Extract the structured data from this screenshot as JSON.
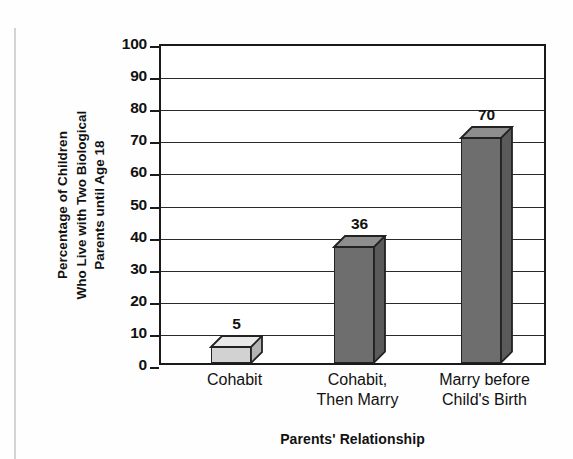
{
  "chart_data": {
    "type": "bar",
    "title": "",
    "categories": [
      "Cohabit",
      "Cohabit, Then Marry",
      "Marry before Child's Birth"
    ],
    "category_lines": [
      [
        "Cohabit"
      ],
      [
        "Cohabit,",
        "Then Marry"
      ],
      [
        "Marry before",
        "Child's Birth"
      ]
    ],
    "values": [
      5,
      36,
      70
    ],
    "data_labels": [
      "5",
      "36",
      "70"
    ],
    "xlabel": "Parents' Relationship",
    "ylabel": "Percentage of Children Who Live with Two Biological Parents until Age 18",
    "ylabel_lines": [
      "Percentage of Children",
      "Who Live with Two Biological",
      "Parents until Age 18"
    ],
    "ylim": [
      0,
      100
    ],
    "ytick_step": 10,
    "yticks": [
      0,
      10,
      20,
      30,
      40,
      50,
      60,
      70,
      80,
      90,
      100
    ],
    "ytick_labels": [
      "0",
      "10",
      "20",
      "30",
      "40",
      "50",
      "60",
      "70",
      "80",
      "90",
      "100"
    ],
    "grid": "horizontal",
    "legend": "none",
    "style": "3d-bars",
    "bar_colors": [
      "#d2d2d2",
      "#6e6e6e",
      "#6e6e6e"
    ],
    "bar_top_colors": [
      "#e9e9e9",
      "#8e8e8e",
      "#8e8e8e"
    ],
    "bar_side_colors": [
      "#b4b4b4",
      "#5a5a5a",
      "#5a5a5a"
    ],
    "outline_color": "#222222",
    "axis_color": "#1a1a1a"
  }
}
